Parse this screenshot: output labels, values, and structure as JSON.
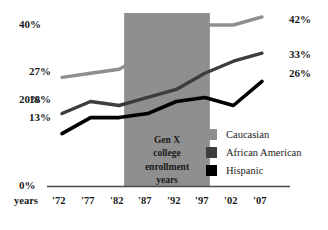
{
  "chart_data": {
    "type": "line",
    "title": "",
    "subtitle": "",
    "xlabel": "years",
    "ylabel": "",
    "x": [
      "'72",
      "'77",
      "'82",
      "'87",
      "'92",
      "'97",
      "'02",
      "'07"
    ],
    "categories": [
      "'72",
      "'77",
      "'82",
      "'87",
      "'92",
      "'97",
      "'02",
      "'07"
    ],
    "ylim": [
      0,
      44
    ],
    "yticks": [
      0,
      20,
      40
    ],
    "ytick_labels": [
      "0%",
      "20%",
      "40%"
    ],
    "grid": false,
    "legend_position": "right-middle",
    "series": [
      {
        "name": "Caucasian",
        "color": "#8f8f8f",
        "values": [
          27,
          28,
          29,
          33,
          36,
          40,
          40,
          42
        ],
        "start_label": "27%",
        "end_label": "42%"
      },
      {
        "name": "African American",
        "color": "#3d3d3d",
        "values": [
          18,
          21,
          20,
          22,
          24,
          28,
          31,
          33
        ],
        "start_label": "18%",
        "end_label": "33%"
      },
      {
        "name": "Hispanic",
        "color": "#000000",
        "values": [
          13,
          17,
          17,
          18,
          21,
          22,
          20,
          26
        ],
        "start_label": "13%",
        "end_label": "26%"
      }
    ],
    "annotations": [
      {
        "name": "gen-x-band",
        "text": "Gen X college enrollment years",
        "lines": [
          "Gen X",
          "college",
          "enrollment",
          "years"
        ],
        "x_start": "'82",
        "x_end": "'97",
        "color": "#8f8f8f"
      }
    ]
  },
  "axis": {
    "y_labels": [
      "40%",
      "20%",
      "0%"
    ],
    "x_axis_caption": "years",
    "x_tick_labels": [
      "'72",
      "'77",
      "'82",
      "'87",
      "'92",
      "'97",
      "'02",
      "'07"
    ]
  },
  "band": {
    "line1": "Gen X",
    "line2": "college",
    "line3": "enrollment",
    "line4": "years"
  },
  "series_labels": {
    "caucasian_start": "27%",
    "caucasian_end": "42%",
    "african_american_start": "18%",
    "african_american_end": "33%",
    "hispanic_start": "13%",
    "hispanic_end": "26%"
  },
  "legend": {
    "items": [
      {
        "label": "Caucasian",
        "color": "#8f8f8f"
      },
      {
        "label": "African American",
        "color": "#3d3d3d"
      },
      {
        "label": "Hispanic",
        "color": "#000000"
      }
    ]
  },
  "colors": {
    "caucasian": "#8f8f8f",
    "african_american": "#3d3d3d",
    "hispanic": "#000000",
    "band": "#8f8f8f",
    "axis": "#4a4a4a",
    "text": "#1a1a1a",
    "background": "#ffffff"
  }
}
